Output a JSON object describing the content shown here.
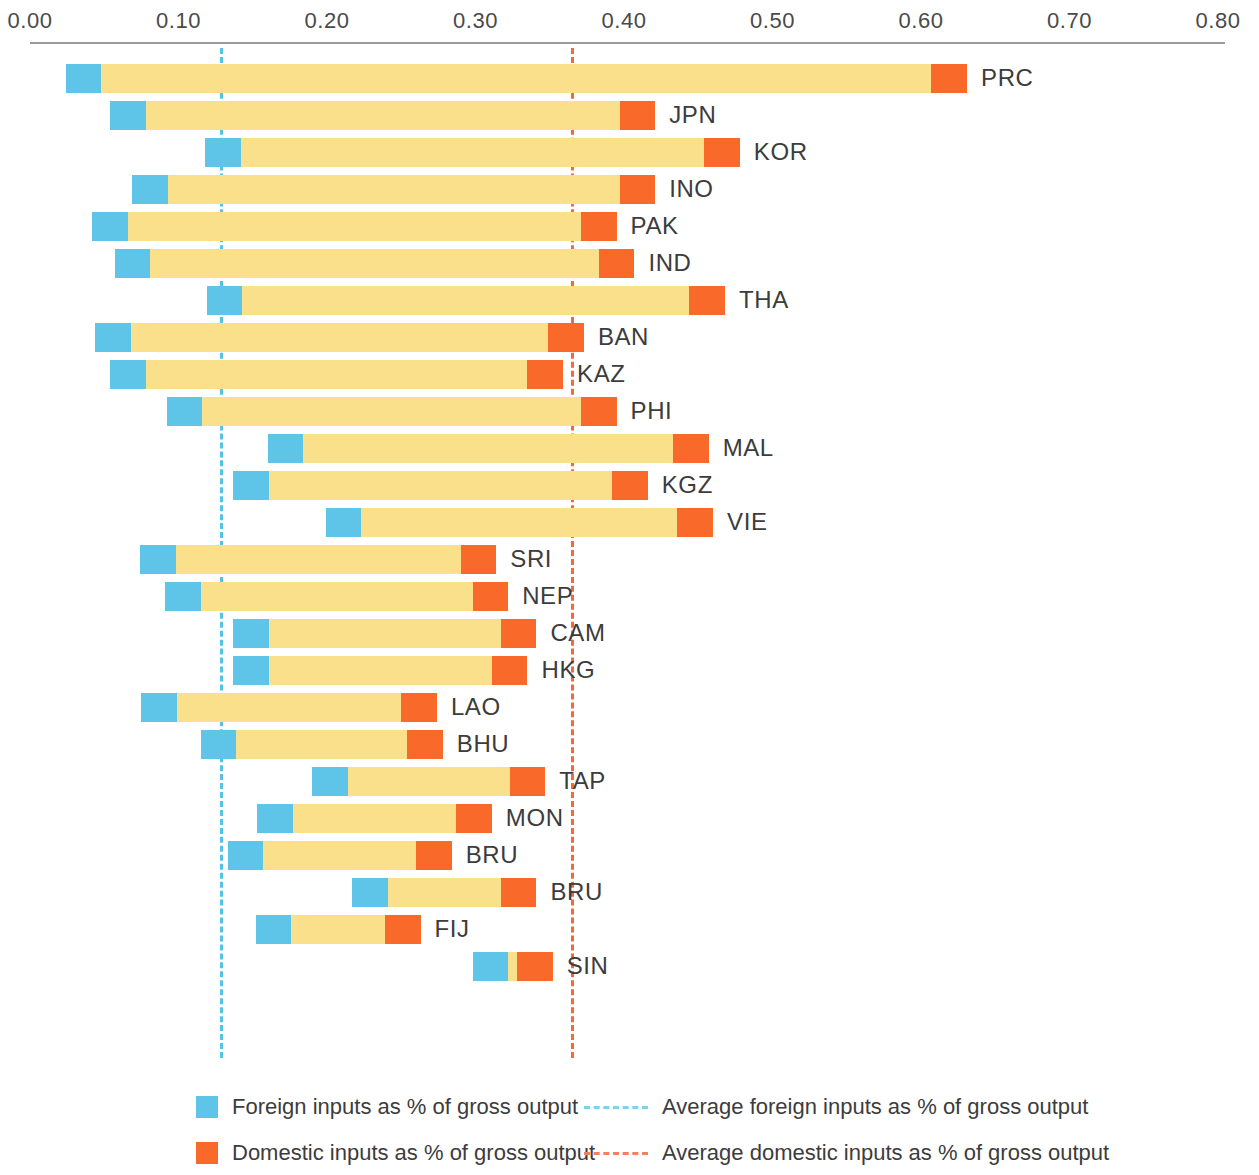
{
  "chart_data": {
    "type": "bar",
    "title": "",
    "subtitle": "",
    "xlabel": "",
    "ylabel": "",
    "orientation": "horizontal",
    "stacked_range_bars": true,
    "grid": false,
    "xlim": [
      0.0,
      0.8
    ],
    "xticks": [
      "0.00",
      "0.10",
      "0.20",
      "0.30",
      "0.40",
      "0.50",
      "0.60",
      "0.70",
      "0.80"
    ],
    "xtick_values": [
      0.0,
      0.1,
      0.2,
      0.3,
      0.4,
      0.5,
      0.6,
      0.7,
      0.8
    ],
    "legend_position": "bottom",
    "annotations": [
      {
        "name": "average-foreign-line",
        "value": 0.128,
        "color": "#55c2e6",
        "style": "dashed"
      },
      {
        "name": "average-domestic-line",
        "value": 0.364,
        "color": "#f4683a",
        "style": "dashed"
      }
    ],
    "series": [
      {
        "name": "Foreign inputs as % of gross output",
        "color": "#5ec5e8"
      },
      {
        "name": "Domestic inputs as % of gross output",
        "color": "#f8692a"
      }
    ],
    "categories": [
      "PRC",
      "JPN",
      "KOR",
      "INO",
      "PAK",
      "IND",
      "THA",
      "BAN",
      "KAZ",
      "PHI",
      "MAL",
      "KGZ",
      "VIE",
      "SRI",
      "NEP",
      "CAM",
      "HKG",
      "LAO",
      "BHU",
      "TAP",
      "MON",
      "BRU",
      "BRU",
      "FIJ",
      "SIN"
    ],
    "bars": [
      {
        "label": "PRC",
        "start": 0.024,
        "foreign_end": 0.048,
        "domestic_start": 0.607,
        "end": 0.631
      },
      {
        "label": "JPN",
        "start": 0.054,
        "foreign_end": 0.078,
        "domestic_start": 0.397,
        "end": 0.421
      },
      {
        "label": "KOR",
        "start": 0.118,
        "foreign_end": 0.142,
        "domestic_start": 0.454,
        "end": 0.478
      },
      {
        "label": "INO",
        "start": 0.069,
        "foreign_end": 0.093,
        "domestic_start": 0.397,
        "end": 0.421
      },
      {
        "label": "PAK",
        "start": 0.042,
        "foreign_end": 0.066,
        "domestic_start": 0.371,
        "end": 0.395
      },
      {
        "label": "IND",
        "start": 0.057,
        "foreign_end": 0.081,
        "domestic_start": 0.383,
        "end": 0.407
      },
      {
        "label": "THA",
        "start": 0.119,
        "foreign_end": 0.143,
        "domestic_start": 0.444,
        "end": 0.468
      },
      {
        "label": "BAN",
        "start": 0.044,
        "foreign_end": 0.068,
        "domestic_start": 0.349,
        "end": 0.373
      },
      {
        "label": "KAZ",
        "start": 0.054,
        "foreign_end": 0.078,
        "domestic_start": 0.335,
        "end": 0.359
      },
      {
        "label": "PHI",
        "start": 0.092,
        "foreign_end": 0.116,
        "domestic_start": 0.371,
        "end": 0.395
      },
      {
        "label": "MAL",
        "start": 0.16,
        "foreign_end": 0.184,
        "domestic_start": 0.433,
        "end": 0.457
      },
      {
        "label": "KGZ",
        "start": 0.137,
        "foreign_end": 0.161,
        "domestic_start": 0.392,
        "end": 0.416
      },
      {
        "label": "VIE",
        "start": 0.199,
        "foreign_end": 0.223,
        "domestic_start": 0.436,
        "end": 0.46
      },
      {
        "label": "SRI",
        "start": 0.074,
        "foreign_end": 0.098,
        "domestic_start": 0.29,
        "end": 0.314
      },
      {
        "label": "NEP",
        "start": 0.091,
        "foreign_end": 0.115,
        "domestic_start": 0.298,
        "end": 0.322
      },
      {
        "label": "CAM",
        "start": 0.137,
        "foreign_end": 0.161,
        "domestic_start": 0.317,
        "end": 0.341
      },
      {
        "label": "HKG",
        "start": 0.137,
        "foreign_end": 0.161,
        "domestic_start": 0.311,
        "end": 0.335
      },
      {
        "label": "LAO",
        "start": 0.075,
        "foreign_end": 0.099,
        "domestic_start": 0.25,
        "end": 0.274
      },
      {
        "label": "BHU",
        "start": 0.115,
        "foreign_end": 0.139,
        "domestic_start": 0.254,
        "end": 0.278
      },
      {
        "label": "TAP",
        "start": 0.19,
        "foreign_end": 0.214,
        "domestic_start": 0.323,
        "end": 0.347
      },
      {
        "label": "MON",
        "start": 0.153,
        "foreign_end": 0.177,
        "domestic_start": 0.287,
        "end": 0.311
      },
      {
        "label": "BRU",
        "start": 0.133,
        "foreign_end": 0.157,
        "domestic_start": 0.26,
        "end": 0.284
      },
      {
        "label": "BRU",
        "start": 0.217,
        "foreign_end": 0.241,
        "domestic_start": 0.317,
        "end": 0.341
      },
      {
        "label": "FIJ",
        "start": 0.152,
        "foreign_end": 0.176,
        "domestic_start": 0.239,
        "end": 0.263
      },
      {
        "label": "SIN",
        "start": 0.298,
        "foreign_end": 0.322,
        "domestic_start": 0.328,
        "end": 0.352
      }
    ]
  },
  "legend": {
    "foreign_swatch_label": "Foreign inputs as % of gross output",
    "domestic_swatch_label": "Domestic inputs as % of gross output",
    "avg_foreign_label": "Average foreign inputs as % of gross output",
    "avg_domestic_label": "Average domestic inputs as % of gross output"
  },
  "colors": {
    "foreign": "#5ec5e8",
    "mid": "#fae08a",
    "domestic": "#f8692a",
    "avg_foreign_line": "#55c2e6",
    "avg_domestic_line": "#f4683a",
    "axis": "#9b9b9b",
    "text": "#3c3c3c"
  }
}
